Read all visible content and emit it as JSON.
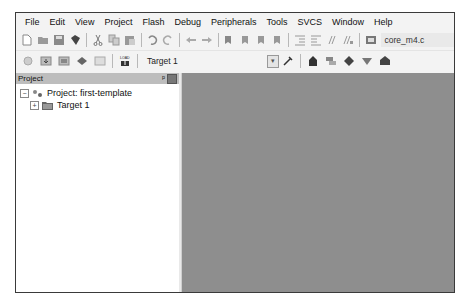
{
  "menubar": {
    "items": [
      "File",
      "Edit",
      "View",
      "Project",
      "Flash",
      "Debug",
      "Peripherals",
      "Tools",
      "SVCS",
      "Window",
      "Help"
    ]
  },
  "toolbar1": {
    "icons": [
      "new-file",
      "open-file",
      "save",
      "save-all",
      "cut",
      "copy",
      "paste",
      "undo",
      "redo",
      "navigate-back",
      "navigate-forward",
      "bookmark-insert",
      "bookmark-prev",
      "bookmark-next",
      "bookmark-clear",
      "indent",
      "unindent",
      "comment",
      "uncomment",
      "find-in-files"
    ],
    "file_combo_value": "core_m4.c"
  },
  "toolbar2": {
    "icons": [
      "translate",
      "build",
      "rebuild",
      "batch-build",
      "stop-build",
      "download"
    ],
    "target_combo_value": "Target 1",
    "target_icons": [
      "target-options",
      "manage-project-items",
      "select-packs",
      "manage-run-time-environment",
      "pack-installer"
    ]
  },
  "project_panel": {
    "title": "Project",
    "pin_label": "ᵖ",
    "tree": {
      "root_label": "Project: first-template",
      "root_expander": "−",
      "children": [
        {
          "label": "Target 1",
          "expander": "+"
        }
      ]
    }
  },
  "colors": {
    "editor_background": "#8e8e8e",
    "panel_header": "#bdbdbd",
    "window_chrome": "#f3f3f3"
  }
}
